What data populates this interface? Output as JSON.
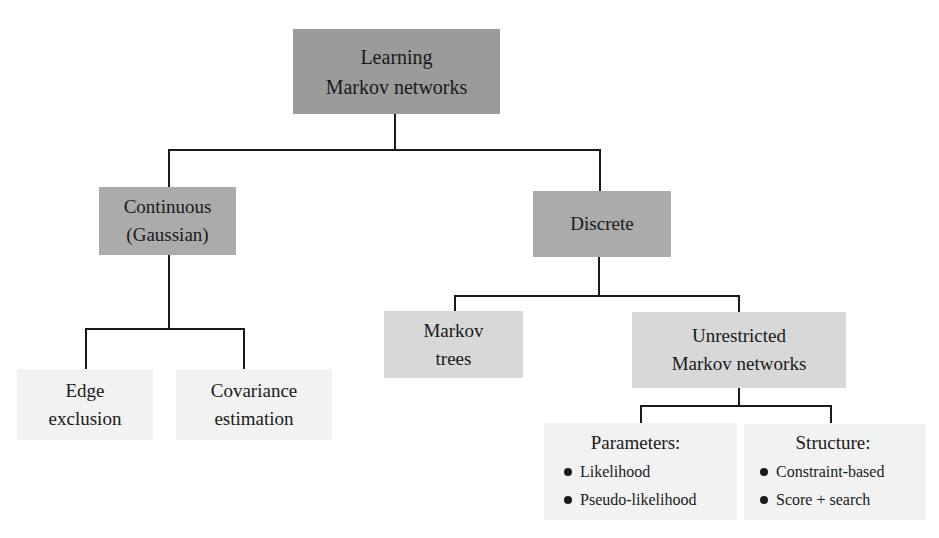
{
  "diagram": {
    "type": "tree",
    "root": {
      "label_line1": "Learning",
      "label_line2": "Markov networks"
    },
    "continuous": {
      "label_line1": "Continuous",
      "label_line2": "(Gaussian)",
      "children": {
        "edge": {
          "label_line1": "Edge",
          "label_line2": "exclusion"
        },
        "covariance": {
          "label_line1": "Covariance",
          "label_line2": "estimation"
        }
      }
    },
    "discrete": {
      "label": "Discrete",
      "children": {
        "trees": {
          "label_line1": "Markov",
          "label_line2": "trees"
        },
        "unrestricted": {
          "label_line1": "Unrestricted",
          "label_line2": "Markov networks",
          "children": {
            "parameters": {
              "title": "Parameters:",
              "items": [
                "Likelihood",
                "Pseudo-likelihood"
              ]
            },
            "structure": {
              "title": "Structure:",
              "items": [
                "Constraint-based",
                "Score + search"
              ]
            }
          }
        }
      }
    },
    "colors": {
      "level0": "#9b9b9b",
      "level1": "#ababab",
      "level2": "#d8d8d8",
      "level3": "#f2f2f2",
      "connector": "#1a1a1a"
    }
  }
}
